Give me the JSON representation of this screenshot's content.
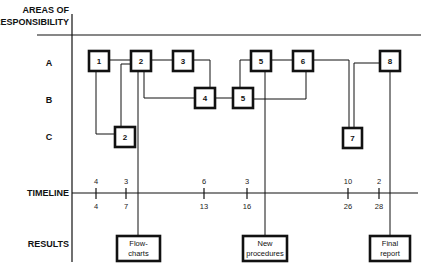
{
  "header": {
    "title_line1": "AREAS OF",
    "title_line2": "RESPONSIBILITY"
  },
  "rows": [
    {
      "id": "A",
      "label": "A"
    },
    {
      "id": "B",
      "label": "B"
    },
    {
      "id": "C",
      "label": "C"
    }
  ],
  "timeline_label": "TIMELINE",
  "results_label": "RESULTS",
  "tasks": [
    {
      "id": "t1",
      "label": "1",
      "row": "A"
    },
    {
      "id": "t2a",
      "label": "2",
      "row": "A"
    },
    {
      "id": "t2c",
      "label": "2",
      "row": "C"
    },
    {
      "id": "t3",
      "label": "3",
      "row": "A"
    },
    {
      "id": "t4",
      "label": "4",
      "row": "B"
    },
    {
      "id": "t5b",
      "label": "5",
      "row": "B"
    },
    {
      "id": "t5a",
      "label": "5",
      "row": "A"
    },
    {
      "id": "t6",
      "label": "6",
      "row": "A"
    },
    {
      "id": "t7",
      "label": "7",
      "row": "C"
    },
    {
      "id": "t8",
      "label": "8",
      "row": "A"
    }
  ],
  "timeline_ticks": [
    {
      "top": "4",
      "bottom": "4"
    },
    {
      "top": "3",
      "bottom": "7"
    },
    {
      "top": "6",
      "bottom": "13"
    },
    {
      "top": "3",
      "bottom": "16"
    },
    {
      "top": "10",
      "bottom": "26"
    },
    {
      "top": "2",
      "bottom": "28"
    }
  ],
  "results": [
    {
      "id": "r1",
      "line1": "Flow-",
      "line2": "charts"
    },
    {
      "id": "r2",
      "line1": "New",
      "line2": "procedures"
    },
    {
      "id": "r3",
      "line1": "Final",
      "line2": "report"
    }
  ]
}
